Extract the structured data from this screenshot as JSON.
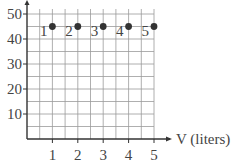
{
  "chart_data": {
    "type": "scatter",
    "title": "",
    "xlabel": "V (liters)",
    "ylabel": "",
    "x_ticks": [
      1,
      2,
      3,
      4,
      5
    ],
    "y_ticks": [
      10,
      20,
      30,
      40,
      50
    ],
    "xlim": [
      0,
      5
    ],
    "ylim": [
      0,
      55
    ],
    "grid": true,
    "grid_minor_step_x": 0.5,
    "grid_minor_step_y": 5,
    "series": [
      {
        "name": "points",
        "x": [
          1,
          2,
          3,
          4,
          5
        ],
        "y": [
          45,
          45,
          45,
          45,
          45
        ],
        "labels": [
          "1",
          "2",
          "3",
          "4",
          "5"
        ]
      }
    ],
    "legend": null
  },
  "colors": {
    "grid": "#9a9a9a",
    "axis": "#333333",
    "point": "#333333",
    "text": "#444444"
  }
}
